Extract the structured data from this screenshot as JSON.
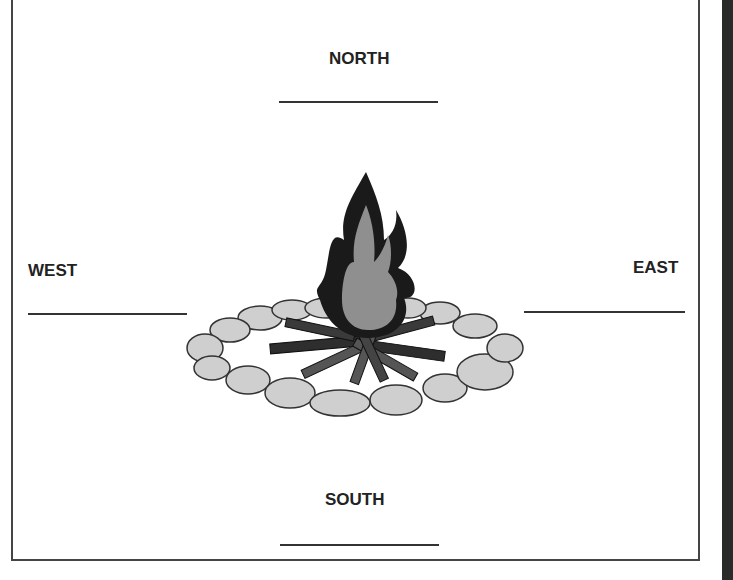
{
  "worksheet": {
    "north": "NORTH",
    "south": "SOUTH",
    "east": "EAST",
    "west": "WEST"
  },
  "illustration": {
    "name": "campfire-with-stone-ring"
  },
  "colors": {
    "flame_outer": "#1a1a1a",
    "flame_inner": "#8f8f8f",
    "stones": "#cfcfcf",
    "logs_dark": "#2e2e2e",
    "logs_mid": "#555555"
  }
}
